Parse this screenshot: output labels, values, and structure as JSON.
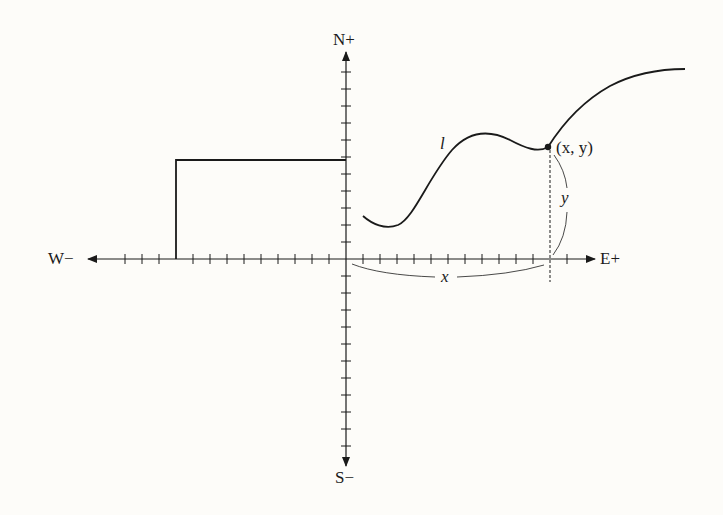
{
  "diagram": {
    "type": "coordinate-plane",
    "axes": {
      "north": "N+",
      "south": "S−",
      "east": "E+",
      "west": "W−"
    },
    "curve_label": "l",
    "point_label": "(x, y)",
    "x_distance_label": "x",
    "y_distance_label": "y",
    "colors": {
      "ink": "#1a1a1a",
      "background": "#fdfcf9"
    },
    "geometry": {
      "origin": [
        346,
        259
      ],
      "tick_spacing": 17,
      "rectangle": {
        "left": 176,
        "top": 160,
        "right": 346,
        "bottom": 259
      },
      "point": [
        548,
        147
      ]
    }
  }
}
